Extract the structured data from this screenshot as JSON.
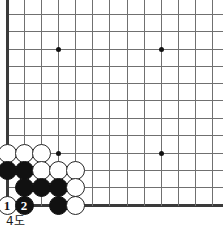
{
  "diagram": {
    "caption": "4도",
    "kind": "go-board-corner-diagram",
    "colors": {
      "grid_line": "#707070",
      "board_edge": "#3a3a3a",
      "black_stone": "#111111",
      "white_stone": "#ffffff",
      "stone_outline": "#262626",
      "background": "#ffffff"
    }
  },
  "board": {
    "columns_px": [
      7,
      24,
      41,
      58,
      75,
      92,
      109,
      127,
      144,
      161,
      178,
      195,
      212
    ],
    "rows_px": [
      14,
      31,
      49,
      66,
      83,
      100,
      118,
      135,
      153,
      170,
      187,
      205
    ],
    "left_edge": true,
    "bottom_edge": true,
    "top_cut_off": true,
    "right_cut_off": true,
    "star_points": [
      {
        "name": "star-upper-left",
        "x": 58,
        "y": 49
      },
      {
        "name": "star-upper-right",
        "x": 161,
        "y": 49
      },
      {
        "name": "star-lower-left",
        "x": 58,
        "y": 153
      },
      {
        "name": "star-lower-right",
        "x": 161,
        "y": 153
      }
    ]
  },
  "stones": [
    {
      "name": "white-stone-a",
      "color": "white",
      "x": 7,
      "y": 153,
      "label": ""
    },
    {
      "name": "white-stone-b",
      "color": "white",
      "x": 24,
      "y": 153,
      "label": ""
    },
    {
      "name": "white-stone-c",
      "color": "white",
      "x": 41,
      "y": 153,
      "label": ""
    },
    {
      "name": "black-stone-a",
      "color": "black",
      "x": 7,
      "y": 170,
      "label": ""
    },
    {
      "name": "black-stone-b",
      "color": "black",
      "x": 24,
      "y": 170,
      "label": ""
    },
    {
      "name": "white-stone-d",
      "color": "white",
      "x": 41,
      "y": 170,
      "label": ""
    },
    {
      "name": "white-stone-e",
      "color": "white",
      "x": 58,
      "y": 170,
      "label": ""
    },
    {
      "name": "white-stone-f",
      "color": "white",
      "x": 75,
      "y": 170,
      "label": ""
    },
    {
      "name": "black-stone-c",
      "color": "black",
      "x": 24,
      "y": 187,
      "label": ""
    },
    {
      "name": "black-stone-d",
      "color": "black",
      "x": 41,
      "y": 187,
      "label": ""
    },
    {
      "name": "black-stone-e",
      "color": "black",
      "x": 58,
      "y": 187,
      "label": ""
    },
    {
      "name": "white-stone-g",
      "color": "white",
      "x": 75,
      "y": 187,
      "label": ""
    },
    {
      "name": "white-stone-move-1",
      "color": "white",
      "x": 7,
      "y": 205,
      "label": "1"
    },
    {
      "name": "black-stone-move-2",
      "color": "black",
      "x": 24,
      "y": 205,
      "label": "2"
    },
    {
      "name": "black-stone-f",
      "color": "black",
      "x": 58,
      "y": 205,
      "label": ""
    },
    {
      "name": "white-stone-h",
      "color": "white",
      "x": 75,
      "y": 205,
      "label": ""
    }
  ]
}
